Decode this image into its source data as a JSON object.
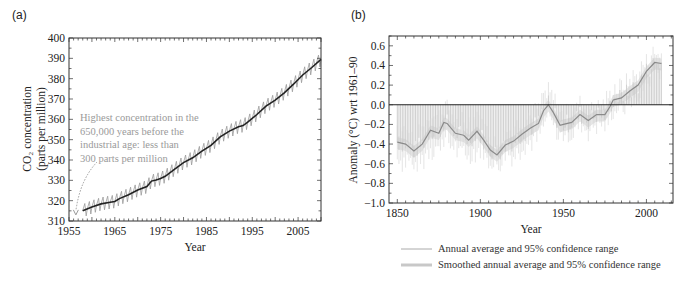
{
  "chart_data": [
    {
      "panel": "(a)",
      "type": "line",
      "title": "",
      "xlabel": "Year",
      "ylabel": "CO2 concentration (parts per million)",
      "ylabel_lines": [
        "CO₂ concentration",
        "(parts per million)"
      ],
      "xlim": [
        1955,
        2010
      ],
      "ylim": [
        310,
        400
      ],
      "xticks": [
        1955,
        1965,
        1975,
        1985,
        1995,
        2005
      ],
      "yticks": [
        310,
        320,
        330,
        340,
        350,
        360,
        370,
        380,
        390,
        400
      ],
      "grid": false,
      "annotation": {
        "lines": [
          "Highest concentration in the",
          "650,000 years before the",
          "industrial age: less than",
          "300 parts per million"
        ],
        "arrow_to": [
          1956.5,
          313
        ]
      },
      "series": [
        {
          "name": "Annual mean",
          "style": "solid-dark",
          "x": [
            1958,
            1960,
            1962,
            1964,
            1965,
            1966,
            1968,
            1970,
            1972,
            1973,
            1974,
            1975,
            1976,
            1978,
            1980,
            1982,
            1984,
            1986,
            1988,
            1990,
            1992,
            1993,
            1994,
            1996,
            1998,
            1999,
            2000,
            2002,
            2004,
            2006,
            2008,
            2010
          ],
          "values": [
            315,
            316.9,
            318.4,
            319.2,
            319.6,
            321,
            322.9,
            325.2,
            326.9,
            329.6,
            330.2,
            330.9,
            332,
            335.4,
            338.7,
            341.1,
            344.4,
            347.2,
            351.4,
            354.2,
            356.4,
            356.9,
            358.6,
            362.4,
            366.5,
            368,
            369.4,
            373,
            377.3,
            381.8,
            385.5,
            389.5
          ]
        },
        {
          "name": "Monthly values (seasonal cycle)",
          "style": "sawtooth-gray",
          "amplitude_ppm": 3.2
        }
      ]
    },
    {
      "panel": "(b)",
      "type": "bar",
      "title": "",
      "xlabel": "Year",
      "ylabel": "Anomaly (°C) wrt 1961–90",
      "xlim": [
        1845,
        2016
      ],
      "ylim": [
        -1.0,
        0.7
      ],
      "xticks": [
        1850,
        1900,
        1950,
        2000
      ],
      "yticks": [
        -1.0,
        -0.8,
        -0.6,
        -0.4,
        -0.2,
        0.0,
        0.2,
        0.4,
        0.6
      ],
      "ytick_labels": [
        "−1.0",
        "−0.8",
        "−0.6",
        "−0.4",
        "−0.2",
        "0.0",
        "0.2",
        "0.4",
        "0.6"
      ],
      "grid": false,
      "zero_line": true,
      "smoothed": {
        "name": "Smoothed annual average",
        "x": [
          1850,
          1855,
          1860,
          1865,
          1870,
          1875,
          1878,
          1880,
          1885,
          1890,
          1893,
          1898,
          1902,
          1906,
          1910,
          1915,
          1920,
          1925,
          1930,
          1935,
          1938,
          1941,
          1944,
          1948,
          1950,
          1955,
          1960,
          1965,
          1970,
          1975,
          1978,
          1980,
          1985,
          1990,
          1995,
          2000,
          2005,
          2009
        ],
        "values": [
          -0.38,
          -0.4,
          -0.47,
          -0.4,
          -0.26,
          -0.29,
          -0.18,
          -0.19,
          -0.29,
          -0.31,
          -0.36,
          -0.27,
          -0.36,
          -0.46,
          -0.51,
          -0.41,
          -0.37,
          -0.3,
          -0.24,
          -0.19,
          -0.06,
          0.0,
          -0.08,
          -0.21,
          -0.2,
          -0.18,
          -0.1,
          -0.16,
          -0.1,
          -0.1,
          -0.02,
          0.05,
          0.07,
          0.14,
          0.2,
          0.34,
          0.43,
          0.42
        ]
      },
      "annual_noise": 0.1,
      "ci_halfwidth": 0.12,
      "legend": [
        {
          "label": "Annual average and 95% confidence range",
          "style": "thin-line"
        },
        {
          "label": "Smoothed annual average and 95% confidence range",
          "style": "thick-band"
        }
      ],
      "legend_position": "bottom"
    }
  ],
  "colors": {
    "axis": "#333333",
    "co2_line": "#222222",
    "co2_saw": "#9a9a9a",
    "bars": "#b8b8b8",
    "ci": "#d4d4d4",
    "smooth": "#8a8a8a",
    "annotation": "#9a9a9a"
  }
}
